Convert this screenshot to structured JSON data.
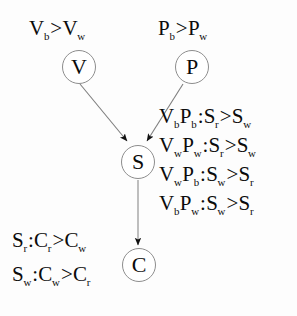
{
  "diagram": {
    "type": "causal-graph",
    "background_color": "#fdfdfd",
    "node_stroke_color": "#8d8d8d",
    "text_color": "#0b0b0b",
    "nodes": [
      {
        "id": "V",
        "label": "V",
        "x": 62,
        "y": 50,
        "size": 34
      },
      {
        "id": "P",
        "label": "P",
        "x": 175,
        "y": 50,
        "size": 34
      },
      {
        "id": "S",
        "label": "S",
        "x": 121,
        "y": 145,
        "size": 34
      },
      {
        "id": "C",
        "label": "C",
        "x": 122,
        "y": 248,
        "size": 34
      }
    ],
    "edges": [
      {
        "from": "V",
        "to": "S",
        "arrow": true
      },
      {
        "from": "P",
        "to": "S",
        "arrow": true
      },
      {
        "from": "S",
        "to": "C",
        "arrow": true
      }
    ],
    "top_left_label": {
      "base1": "V",
      "sub1": "b",
      "relation": ">",
      "base2": "V",
      "sub2": "w"
    },
    "top_right_label": {
      "base1": "P",
      "sub1": "b",
      "relation": ">",
      "base2": "P",
      "sub2": "w"
    },
    "right_equations": [
      {
        "cond1": "V",
        "cond1_sub": "b",
        "cond2": "P",
        "cond2_sub": "b",
        "colon": ":",
        "left": "S",
        "left_sub": "r",
        "relation": ">",
        "right": "S",
        "right_sub": "w"
      },
      {
        "cond1": "V",
        "cond1_sub": "w",
        "cond2": "P",
        "cond2_sub": "w",
        "colon": ":",
        "left": "S",
        "left_sub": "r",
        "relation": ">",
        "right": "S",
        "right_sub": "w"
      },
      {
        "cond1": "V",
        "cond1_sub": "w",
        "cond2": "P",
        "cond2_sub": "b",
        "colon": ":",
        "left": "S",
        "left_sub": "w",
        "relation": ">",
        "right": "S",
        "right_sub": "r"
      },
      {
        "cond1": "V",
        "cond1_sub": "b",
        "cond2": "P",
        "cond2_sub": "w",
        "colon": ":",
        "left": "S",
        "left_sub": "w",
        "relation": ">",
        "right": "S",
        "right_sub": "r"
      }
    ],
    "bottom_left_equations": [
      {
        "cond": "S",
        "cond_sub": "r",
        "colon": ":",
        "left": "C",
        "left_sub": "r",
        "relation": ">",
        "right": "C",
        "right_sub": "w"
      },
      {
        "cond": "S",
        "cond_sub": "w",
        "colon": ":",
        "left": "C",
        "left_sub": "w",
        "relation": ">",
        "right": "C",
        "right_sub": "r"
      }
    ]
  }
}
